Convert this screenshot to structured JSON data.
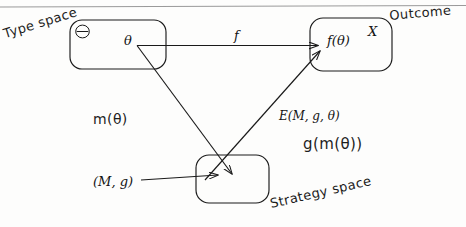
{
  "diagram": {
    "top_rule": true,
    "nodes": [
      {
        "id": "type-space",
        "corner_label": "Θ",
        "element_label": "θ",
        "annotation": "Type space"
      },
      {
        "id": "outcome",
        "corner_label": "X",
        "element_label": "f(θ)",
        "annotation": "Outcome"
      },
      {
        "id": "strategy-space",
        "corner_label": "",
        "element_label": "",
        "annotation": "Strategy space"
      }
    ],
    "edges": [
      {
        "id": "theta-to-outcome",
        "from": "type-space",
        "to": "outcome",
        "label": "f"
      },
      {
        "id": "theta-to-strategy",
        "from": "type-space",
        "to": "strategy-space",
        "label": "m(θ)"
      },
      {
        "id": "strategy-to-outcome",
        "from": "strategy-space",
        "to": "outcome",
        "label": "E(M, g, θ)",
        "label_secondary": "g(m(θ))"
      },
      {
        "id": "mechanism-to-strategy",
        "from": "mechanism",
        "to": "strategy-space",
        "label": "(M, g)"
      }
    ],
    "colors": {
      "ink": "#1d1d1d",
      "paper": "#fdfdfc",
      "rule": "#8e8e8e"
    }
  }
}
